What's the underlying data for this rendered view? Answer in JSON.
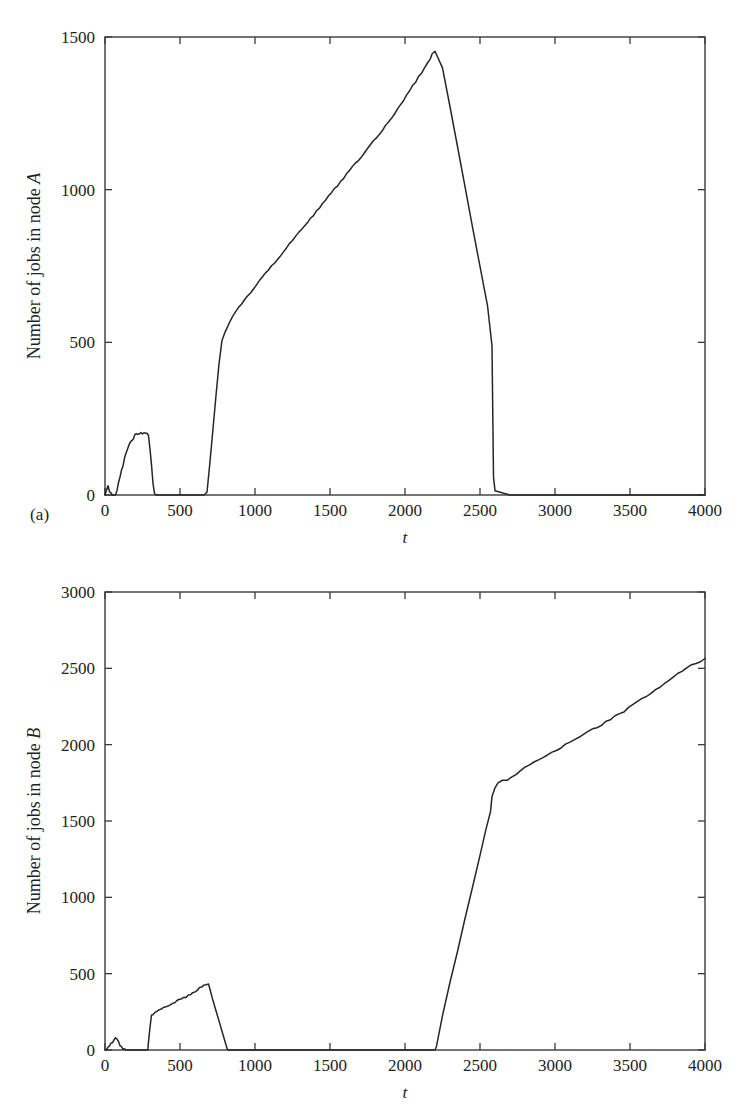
{
  "figure": {
    "panels": [
      {
        "caption": "(a)",
        "ylabel_prefix": "Number of jobs in node ",
        "ylabel_node": "A",
        "xlabel": "t"
      },
      {
        "caption": "(b)",
        "ylabel_prefix": "Number of jobs in node ",
        "ylabel_node": "B",
        "xlabel": "t"
      }
    ]
  },
  "chart_data": [
    {
      "type": "line",
      "title": "",
      "subtitle": "",
      "panel": "(a)",
      "xlabel": "t",
      "ylabel": "Number of jobs in node A",
      "xlim": [
        0,
        4000
      ],
      "ylim": [
        0,
        1500
      ],
      "xticks": [
        0,
        500,
        1000,
        1500,
        2000,
        2500,
        3000,
        3500,
        4000
      ],
      "yticks": [
        0,
        500,
        1000,
        1500
      ],
      "xticklabels": [
        "0",
        "500",
        "1000",
        "1500",
        "2000",
        "2500",
        "3000",
        "3500",
        "4000"
      ],
      "yticklabels": [
        "0",
        "500",
        "1000",
        "1500"
      ],
      "grid": false,
      "legend": null,
      "series": [
        {
          "name": "Number of jobs in node A",
          "color": "#262626",
          "x": [
            0,
            10,
            20,
            30,
            40,
            50,
            60,
            70,
            80,
            90,
            100,
            110,
            120,
            130,
            140,
            150,
            160,
            170,
            180,
            190,
            200,
            210,
            220,
            230,
            240,
            250,
            260,
            270,
            280,
            290,
            300,
            310,
            320,
            330,
            340,
            400,
            500,
            600,
            660,
            680,
            700,
            720,
            740,
            760,
            780,
            800,
            810,
            830,
            850,
            870,
            890,
            910,
            930,
            950,
            970,
            990,
            1010,
            1030,
            1050,
            1070,
            1090,
            1110,
            1130,
            1150,
            1170,
            1190,
            1210,
            1230,
            1250,
            1270,
            1290,
            1310,
            1330,
            1350,
            1370,
            1390,
            1410,
            1430,
            1450,
            1470,
            1490,
            1510,
            1530,
            1550,
            1570,
            1590,
            1610,
            1630,
            1650,
            1670,
            1690,
            1710,
            1730,
            1750,
            1770,
            1790,
            1810,
            1830,
            1850,
            1870,
            1890,
            1910,
            1930,
            1950,
            1970,
            1990,
            2010,
            2030,
            2050,
            2070,
            2090,
            2110,
            2130,
            2150,
            2170,
            2180,
            2200,
            2250,
            2300,
            2350,
            2400,
            2450,
            2500,
            2550,
            2580,
            2590,
            2600,
            2700,
            2800,
            3000,
            3200,
            3400,
            3600,
            3800,
            4000
          ],
          "y": [
            0,
            18,
            28,
            10,
            4,
            2,
            0,
            0,
            12,
            38,
            62,
            80,
            96,
            118,
            134,
            150,
            162,
            172,
            180,
            186,
            196,
            200,
            196,
            202,
            206,
            200,
            204,
            200,
            205,
            196,
            150,
            96,
            40,
            2,
            0,
            0,
            0,
            0,
            0,
            8,
            110,
            215,
            325,
            430,
            505,
            535,
            545,
            565,
            585,
            600,
            612,
            625,
            640,
            652,
            662,
            675,
            690,
            700,
            712,
            726,
            738,
            748,
            762,
            772,
            786,
            796,
            810,
            822,
            832,
            846,
            858,
            868,
            882,
            892,
            906,
            916,
            930,
            940,
            954,
            966,
            978,
            990,
            1002,
            1012,
            1026,
            1038,
            1050,
            1060,
            1074,
            1086,
            1098,
            1110,
            1122,
            1134,
            1146,
            1158,
            1172,
            1184,
            1196,
            1208,
            1222,
            1236,
            1250,
            1264,
            1278,
            1292,
            1308,
            1322,
            1338,
            1352,
            1368,
            1382,
            1398,
            1412,
            1428,
            1442,
            1455,
            1400,
            1270,
            1140,
            1010,
            880,
            748,
            618,
            490,
            60,
            12,
            0,
            0,
            0,
            0,
            0,
            0,
            0,
            0,
            0
          ]
        }
      ]
    },
    {
      "type": "line",
      "title": "",
      "subtitle": "",
      "panel": "(b)",
      "xlabel": "t",
      "ylabel": "Number of jobs in node B",
      "xlim": [
        0,
        4000
      ],
      "ylim": [
        0,
        3000
      ],
      "xticks": [
        0,
        500,
        1000,
        1500,
        2000,
        2500,
        3000,
        3500,
        4000
      ],
      "yticks": [
        0,
        500,
        1000,
        1500,
        2000,
        2500,
        3000
      ],
      "xticklabels": [
        "0",
        "500",
        "1000",
        "1500",
        "2000",
        "2500",
        "3000",
        "3500",
        "4000"
      ],
      "yticklabels": [
        "0",
        "500",
        "1000",
        "1500",
        "2000",
        "2500",
        "3000"
      ],
      "grid": false,
      "legend": null,
      "series": [
        {
          "name": "Number of jobs in node B",
          "color": "#262626",
          "x": [
            0,
            10,
            20,
            30,
            40,
            50,
            60,
            70,
            80,
            90,
            100,
            110,
            120,
            130,
            140,
            200,
            250,
            285,
            290,
            300,
            310,
            320,
            330,
            345,
            360,
            375,
            390,
            405,
            420,
            435,
            450,
            465,
            480,
            495,
            510,
            525,
            540,
            555,
            570,
            585,
            600,
            615,
            630,
            645,
            660,
            675,
            690,
            700,
            720,
            740,
            760,
            780,
            800,
            815,
            820,
            830,
            900,
            1000,
            1200,
            1400,
            1600,
            1800,
            2000,
            2150,
            2200,
            2210,
            2250,
            2300,
            2350,
            2400,
            2450,
            2500,
            2540,
            2570,
            2580,
            2600,
            2620,
            2650,
            2680,
            2710,
            2740,
            2770,
            2800,
            2830,
            2860,
            2890,
            2920,
            2950,
            2980,
            3010,
            3040,
            3070,
            3100,
            3130,
            3160,
            3190,
            3220,
            3250,
            3280,
            3310,
            3340,
            3370,
            3400,
            3430,
            3460,
            3490,
            3520,
            3550,
            3580,
            3610,
            3640,
            3670,
            3700,
            3730,
            3760,
            3790,
            3820,
            3850,
            3880,
            3910,
            3940,
            3970,
            4000
          ],
          "y": [
            0,
            6,
            14,
            26,
            40,
            54,
            68,
            76,
            66,
            50,
            34,
            18,
            8,
            2,
            0,
            0,
            0,
            0,
            55,
            150,
            225,
            232,
            238,
            248,
            258,
            268,
            276,
            284,
            292,
            300,
            306,
            314,
            322,
            330,
            334,
            340,
            348,
            356,
            362,
            372,
            380,
            392,
            406,
            418,
            424,
            430,
            432,
            400,
            330,
            262,
            192,
            120,
            52,
            10,
            0,
            0,
            0,
            0,
            0,
            0,
            0,
            0,
            0,
            0,
            0,
            30,
            230,
            440,
            650,
            860,
            1070,
            1270,
            1450,
            1560,
            1660,
            1720,
            1755,
            1762,
            1770,
            1790,
            1810,
            1830,
            1852,
            1870,
            1888,
            1902,
            1918,
            1936,
            1950,
            1968,
            1984,
            2000,
            2016,
            2032,
            2050,
            2066,
            2082,
            2098,
            2116,
            2132,
            2148,
            2166,
            2184,
            2202,
            2220,
            2240,
            2260,
            2280,
            2300,
            2320,
            2340,
            2360,
            2380,
            2400,
            2420,
            2442,
            2462,
            2482,
            2500,
            2518,
            2534,
            2548,
            2560
          ]
        }
      ]
    }
  ]
}
